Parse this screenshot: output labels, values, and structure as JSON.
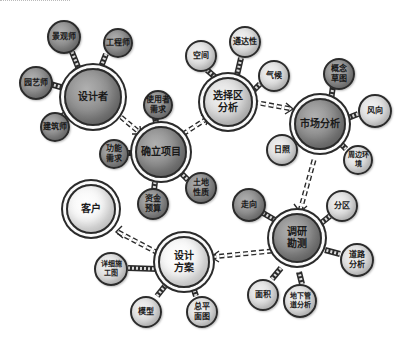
{
  "diagram": {
    "type": "hand-drawn mind map / design process flow",
    "hubs": [
      {
        "id": "designer",
        "label": "设计者",
        "style": "dark"
      },
      {
        "id": "define-project",
        "label": "确立项目",
        "style": "dark"
      },
      {
        "id": "site-analysis",
        "label": "选择区\n分析",
        "style": "light"
      },
      {
        "id": "market-analysis",
        "label": "市场分析",
        "style": "dark"
      },
      {
        "id": "research-survey",
        "label": "调研\n勘测",
        "style": "dark"
      },
      {
        "id": "design-scheme",
        "label": "设计\n方案",
        "style": "white"
      },
      {
        "id": "client",
        "label": "客户",
        "style": "white"
      }
    ],
    "satellites": {
      "designer": [
        "景观师",
        "工程师",
        "园艺师",
        "建筑师"
      ],
      "define-project": [
        "使用者\n需求",
        "功能\n需求",
        "资金\n预算",
        "土地\n性质"
      ],
      "site-analysis": [
        "空间",
        "通达性",
        "气候"
      ],
      "market-analysis": [
        "概念\n草图",
        "风向",
        "日照",
        "周边环境"
      ],
      "research-survey": [
        "走向",
        "分区",
        "道路\n分析",
        "面积",
        "地下管\n道分析"
      ],
      "design-scheme": [
        "详细施\n工图",
        "总平\n面图",
        "模型"
      ]
    },
    "flow": [
      {
        "from": "designer",
        "to": "define-project"
      },
      {
        "from": "define-project",
        "to": "site-analysis"
      },
      {
        "from": "site-analysis",
        "to": "market-analysis"
      },
      {
        "from": "market-analysis",
        "to": "research-survey"
      },
      {
        "from": "research-survey",
        "to": "design-scheme"
      },
      {
        "from": "design-scheme",
        "to": "client"
      }
    ],
    "colors": {
      "dark_fill": "#8a8a8a",
      "light_fill": "#dcdcdc",
      "white_fill": "#f3f3f3",
      "outline": "#2b2b2b",
      "background": "#ffffff"
    }
  }
}
